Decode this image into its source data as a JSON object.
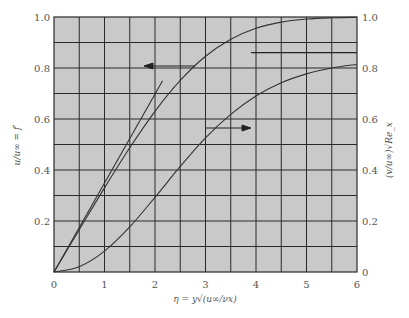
{
  "chart_data": {
    "type": "line",
    "title": "",
    "xlabel": "η = y√(u∞/νx)",
    "ylabel_left": "u/u∞ = f′",
    "ylabel_right": "(v/u∞)√Re_x",
    "xlim": [
      0,
      6
    ],
    "ylim_left": [
      0,
      1.0
    ],
    "ylim_right": [
      0,
      1.0
    ],
    "grid": true,
    "grid_x_step": 0.5,
    "grid_y_step": 0.1,
    "x_ticks": [
      "0",
      "1",
      "2",
      "3",
      "4",
      "5",
      "6"
    ],
    "y_ticks_left": [
      "0.2",
      "0.4",
      "0.6",
      "0.8",
      "1.0"
    ],
    "y_ticks_right": [
      "0",
      "0.2",
      "0.4",
      "0.6",
      "0.8",
      "1.0"
    ],
    "series": [
      {
        "name": "u/u∞ = f′ (left axis)",
        "axis": "left",
        "x": [
          0,
          0.5,
          1.0,
          1.5,
          2.0,
          2.5,
          3.0,
          3.5,
          4.0,
          4.5,
          5.0,
          5.5,
          6.0
        ],
        "values": [
          0,
          0.166,
          0.33,
          0.487,
          0.63,
          0.751,
          0.846,
          0.913,
          0.956,
          0.98,
          0.992,
          0.997,
          0.999
        ]
      },
      {
        "name": "(v/u∞)√Re_x (right axis)",
        "axis": "right",
        "x": [
          0,
          0.5,
          1.0,
          1.5,
          2.0,
          2.5,
          3.0,
          3.5,
          4.0,
          4.5,
          5.0,
          5.5,
          6.0
        ],
        "values": [
          0,
          0.021,
          0.082,
          0.177,
          0.293,
          0.414,
          0.526,
          0.618,
          0.69,
          0.742,
          0.777,
          0.8,
          0.814
        ]
      },
      {
        "name": "initial-slope tangent",
        "axis": "left",
        "x": [
          0,
          2.15
        ],
        "values": [
          0,
          0.75
        ]
      }
    ],
    "annotations": [
      {
        "type": "arrow",
        "direction": "left",
        "label": "points to left axis (f′ curve)"
      },
      {
        "type": "arrow",
        "direction": "right",
        "label": "points to right axis (v curve)"
      },
      {
        "type": "asymptote",
        "axis": "right",
        "value": 0.8604,
        "x_from": 3.9,
        "x_to": 6
      }
    ]
  }
}
